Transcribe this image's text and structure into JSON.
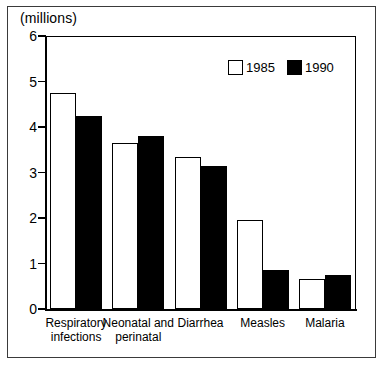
{
  "figure": {
    "unit_label": "(millions)",
    "background_color": "#ffffff",
    "frame_color": "#000000"
  },
  "legend": {
    "position": "top-right-inside",
    "entries": [
      {
        "label": "1985",
        "style": "open",
        "color": "#ffffff"
      },
      {
        "label": "1990",
        "style": "filled",
        "color": "#000000"
      }
    ]
  },
  "chart_data": {
    "type": "bar",
    "title": "",
    "subtitle": "",
    "xlabel": "",
    "ylabel": "(millions)",
    "ylim": [
      0,
      6
    ],
    "yticks": [
      0,
      1,
      2,
      3,
      4,
      5,
      6
    ],
    "ytick_labels": [
      "0",
      "1",
      "2",
      "3",
      "4",
      "5",
      "6"
    ],
    "grid": false,
    "legend_position": "upper right",
    "categories": [
      "Respiratory\ninfections",
      "Neonatal and\nperinatal",
      "Diarrhea",
      "Measles",
      "Malaria"
    ],
    "category_labels_flat": [
      "Respiratory infections",
      "Neonatal and perinatal",
      "Diarrhea",
      "Measles",
      "Malaria"
    ],
    "series": [
      {
        "name": "1985",
        "style": "open",
        "color": "#ffffff",
        "values": [
          4.75,
          3.65,
          3.35,
          1.95,
          0.65
        ]
      },
      {
        "name": "1990",
        "style": "filled",
        "color": "#000000",
        "values": [
          4.25,
          3.8,
          3.15,
          0.85,
          0.75
        ]
      }
    ]
  }
}
